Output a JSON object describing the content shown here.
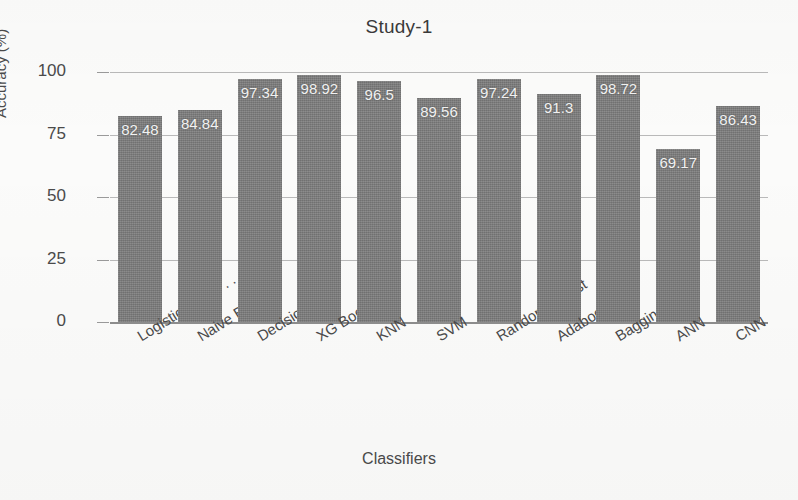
{
  "chart_data": {
    "type": "bar",
    "title": "Study-1",
    "xlabel": "Classifiers",
    "ylabel": "Accuracy (%)",
    "ylim": [
      0,
      100
    ],
    "yticks": [
      0,
      25,
      50,
      75,
      100
    ],
    "ytick_labels": [
      "0",
      "25",
      "50",
      "75",
      "100"
    ],
    "grid": true,
    "legend": "none",
    "bar_color": "#7c7c7c",
    "value_label_color": "#f2f2f2",
    "categories": [
      "Logistic Regre . . .",
      "Naive Bayes",
      "Decision Tree",
      "XG Boost",
      "KNN",
      "SVM",
      "Random Forest",
      "Adaboost",
      "Bagging",
      "ANN",
      "CNN"
    ],
    "values": [
      82.48,
      84.84,
      97.34,
      98.92,
      96.5,
      89.56,
      97.24,
      91.3,
      98.72,
      69.17,
      86.43
    ],
    "value_labels": [
      "82.48",
      "84.84",
      "97.34",
      "98.92",
      "96.5",
      "89.56",
      "97.24",
      "91.3",
      "98.72",
      "69.17",
      "86.43"
    ]
  }
}
